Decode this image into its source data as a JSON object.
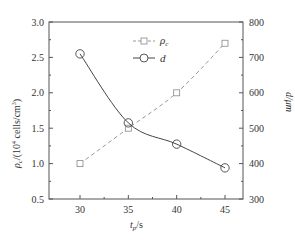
{
  "chart_data": {
    "type": "line",
    "title": "",
    "xlabel": "t_p/s",
    "ylabel_left": "ρ_c/(10^4 cells/cm^3)",
    "ylabel_right": "d/μm",
    "x": [
      30,
      35,
      40,
      45
    ],
    "x_ticks": [
      "30",
      "35",
      "40",
      "45"
    ],
    "xlim": [
      27.5,
      47.5
    ],
    "ylim_left": [
      0.5,
      3.0
    ],
    "ylim_right": [
      300,
      800
    ],
    "y_ticks_left": [
      "0.5",
      "1.0",
      "1.5",
      "2.0",
      "2.5",
      "3.0"
    ],
    "y_ticks_right": [
      "300",
      "400",
      "500",
      "600",
      "700",
      "800"
    ],
    "grid": false,
    "legend_position": "upper-center",
    "series": [
      {
        "name": "ρc",
        "axis": "left",
        "marker": "square",
        "line": "dashed",
        "color": "#999999",
        "values": [
          1.0,
          1.5,
          2.0,
          2.7
        ]
      },
      {
        "name": "d",
        "axis": "right",
        "marker": "circle",
        "line": "solid",
        "color": "#444444",
        "values": [
          710,
          515,
          455,
          388
        ]
      }
    ]
  },
  "labels": {
    "xlabel_main": "t",
    "xlabel_sub": "p",
    "xlabel_rest": "/s",
    "ylabel_left_main": "ρ",
    "ylabel_left_sub": "c",
    "ylabel_left_rest": "/(10",
    "ylabel_left_sup": "4",
    "ylabel_left_rest2": " cells/cm",
    "ylabel_left_sup2": "3",
    "ylabel_left_end": ")",
    "ylabel_right": "d/μm",
    "legend_rho_main": "ρ",
    "legend_rho_sub": "c",
    "legend_d": "d"
  }
}
